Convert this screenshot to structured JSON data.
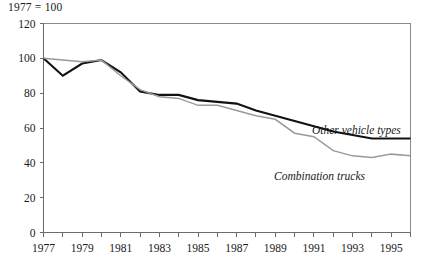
{
  "chart_data": {
    "type": "line",
    "title": "",
    "index_note": "1977 = 100",
    "xlabel": "",
    "ylabel": "",
    "xlim": [
      1977,
      1996
    ],
    "ylim": [
      0,
      120
    ],
    "yticks": [
      0,
      20,
      40,
      60,
      80,
      100,
      120
    ],
    "xticks": [
      1977,
      1978,
      1979,
      1980,
      1981,
      1982,
      1983,
      1984,
      1985,
      1986,
      1987,
      1988,
      1989,
      1990,
      1991,
      1992,
      1993,
      1994,
      1995,
      1996
    ],
    "xtick_labels": [
      "1977",
      "",
      "1979",
      "",
      "1981",
      "",
      "1983",
      "",
      "1985",
      "",
      "1987",
      "",
      "1989",
      "",
      "1991",
      "",
      "1993",
      "",
      "1995",
      ""
    ],
    "grid": false,
    "legend_position": "inline-annotation",
    "x": [
      1977,
      1978,
      1979,
      1980,
      1981,
      1982,
      1983,
      1984,
      1985,
      1986,
      1987,
      1988,
      1989,
      1990,
      1991,
      1992,
      1993,
      1994,
      1995,
      1996
    ],
    "series": [
      {
        "name": "Other vehicle types",
        "color": "#111111",
        "width": 2.1,
        "label": "Other vehicle types",
        "values": [
          100,
          90,
          97,
          99,
          92,
          81,
          79,
          79,
          76,
          75,
          74,
          70,
          67,
          64,
          61,
          58,
          56,
          54,
          54,
          54
        ]
      },
      {
        "name": "Combination trucks",
        "color": "#9a9a9a",
        "width": 1.5,
        "label": "Combination trucks",
        "values": [
          100,
          99,
          98,
          99,
          90,
          82,
          78,
          77,
          73,
          73,
          70,
          67,
          65,
          57,
          55,
          47,
          44,
          43,
          45,
          44
        ]
      }
    ]
  },
  "annotations": {
    "other_vehicle_types": "Other vehicle types",
    "combination_trucks": "Combination trucks"
  }
}
